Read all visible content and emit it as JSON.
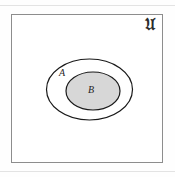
{
  "figure": {
    "type": "euler-venn-diagram",
    "universe": {
      "label": "𝔘",
      "label_plain": "U",
      "label_style": "fraktur",
      "border_color": "#8d8d8d",
      "fill_color": "#ffffff"
    },
    "sets": [
      {
        "id": "A",
        "label": "A",
        "shape": "ellipse",
        "fill_color": "#ffffff",
        "stroke_color": "#1a1a1a",
        "center": [
          89.5,
          89.5
        ],
        "radii": [
          43,
          30.5
        ]
      },
      {
        "id": "B",
        "label": "B",
        "shape": "ellipse",
        "fill_color": "#d7d7d7",
        "stroke_color": "#1a1a1a",
        "center": [
          93,
          91
        ],
        "radii": [
          27,
          19
        ]
      }
    ]
  }
}
